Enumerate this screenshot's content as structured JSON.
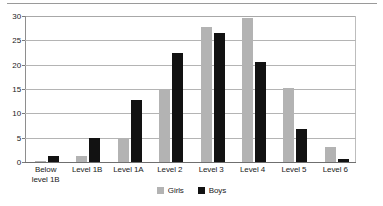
{
  "chart_data": {
    "type": "bar",
    "title": "",
    "subtitle": "",
    "xlabel": "",
    "ylabel": "",
    "ylim": [
      0,
      30
    ],
    "yticks": [
      0,
      5,
      10,
      15,
      20,
      25,
      30
    ],
    "grid": true,
    "legend_position": "bottom-center",
    "categories": [
      "Below\nlevel 1B",
      "Level 1B",
      "Level 1A",
      "Level 2",
      "Level 3",
      "Level 4",
      "Level 5",
      "Level 6"
    ],
    "series": [
      {
        "name": "Girls",
        "color": "#b3b3b3",
        "values": [
          0.3,
          1.2,
          5.0,
          14.9,
          27.7,
          29.5,
          15.3,
          3.0
        ]
      },
      {
        "name": "Boys",
        "color": "#121212",
        "values": [
          1.3,
          5.0,
          12.7,
          22.5,
          26.5,
          20.5,
          6.8,
          0.6
        ]
      }
    ]
  },
  "colors": {
    "girls": "#b3b3b3",
    "boys": "#121212",
    "gridline": "#b4b4b4",
    "axis": "#6f6f6f",
    "background": "#ffffff",
    "text": "#1a1a1a"
  }
}
